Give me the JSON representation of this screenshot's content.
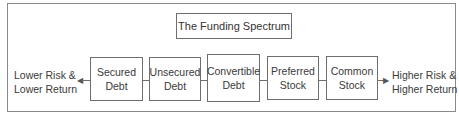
{
  "title": "The Funding Spectrum",
  "left_label": [
    "Lower Risk &",
    "Lower Return"
  ],
  "right_label": [
    "Higher Risk &",
    "Higher Return"
  ],
  "nodes": [
    {
      "line1": "Secured",
      "line2": "Debt"
    },
    {
      "line1": "Unsecured",
      "line2": "Debt"
    },
    {
      "line1": "Convertible",
      "line2": "Debt"
    },
    {
      "line1": "Preferred",
      "line2": "Stock"
    },
    {
      "line1": "Common",
      "line2": "Stock"
    }
  ]
}
